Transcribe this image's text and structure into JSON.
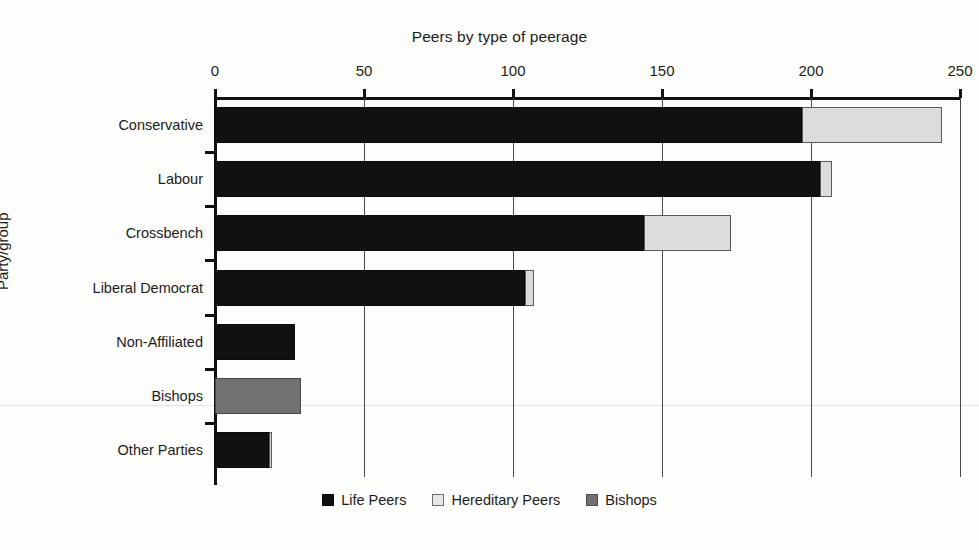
{
  "chart_data": {
    "type": "bar",
    "orientation": "horizontal",
    "stacked": true,
    "title": "Peers by type of peerage",
    "xlabel": "",
    "ylabel": "Party/group",
    "xlim": [
      0,
      250
    ],
    "ylim": null,
    "grid": true,
    "legend_position": "bottom",
    "xticks": [
      0,
      50,
      100,
      150,
      200,
      250
    ],
    "xtick_labels": [
      "0",
      "50",
      "100",
      "150",
      "200",
      "250"
    ],
    "categories": [
      "Conservative",
      "Labour",
      "Crossbench",
      "Liberal Democrat",
      "Non-Affiliated",
      "Bishops",
      "Other Parties"
    ],
    "series": [
      {
        "name": "Life Peers",
        "color": "#111111",
        "values": [
          197,
          203,
          144,
          104,
          27,
          0,
          18
        ]
      },
      {
        "name": "Hereditary Peers",
        "color": "#dcdcdc",
        "values": [
          47,
          4,
          29,
          3,
          0,
          0,
          1
        ]
      },
      {
        "name": "Bishops",
        "color": "#717171",
        "values": [
          0,
          0,
          0,
          0,
          0,
          29,
          0
        ]
      }
    ],
    "totals": [
      244,
      207,
      173,
      107,
      27,
      29,
      19
    ]
  },
  "legend": {
    "items": [
      {
        "label": "Life Peers",
        "swatch": "life-peers-swatch"
      },
      {
        "label": "Hereditary Peers",
        "swatch": "hereditary-peers-swatch"
      },
      {
        "label": "Bishops",
        "swatch": "bishops-swatch"
      }
    ]
  }
}
